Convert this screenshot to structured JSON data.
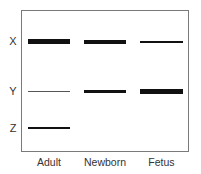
{
  "figure": {
    "type": "gel-electrophoresis",
    "rows": [
      {
        "label": "X"
      },
      {
        "label": "Y"
      },
      {
        "label": "Z"
      }
    ],
    "columns": [
      {
        "label": "Adult"
      },
      {
        "label": "Newborn"
      },
      {
        "label": "Fetus"
      }
    ],
    "bands": [
      {
        "row": "X",
        "column": "Adult",
        "intensity": "strong",
        "thickness_px": 5
      },
      {
        "row": "X",
        "column": "Newborn",
        "intensity": "medium",
        "thickness_px": 4
      },
      {
        "row": "X",
        "column": "Fetus",
        "intensity": "weak",
        "thickness_px": 2
      },
      {
        "row": "Y",
        "column": "Adult",
        "intensity": "very weak",
        "thickness_px": 1
      },
      {
        "row": "Y",
        "column": "Newborn",
        "intensity": "medium",
        "thickness_px": 3
      },
      {
        "row": "Y",
        "column": "Fetus",
        "intensity": "strong",
        "thickness_px": 5
      },
      {
        "row": "Z",
        "column": "Adult",
        "intensity": "weak",
        "thickness_px": 2
      }
    ],
    "colors": {
      "band": "#111111",
      "frame": "#7a7a7a",
      "text": "#333333",
      "background": "#ffffff"
    }
  }
}
